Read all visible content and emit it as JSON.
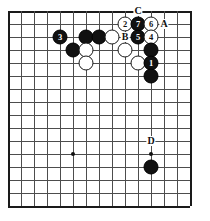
{
  "diagram": {
    "kind": "go-board-diagram",
    "title": "",
    "board": {
      "cols": 15,
      "rows": 16,
      "origin_x": 8,
      "origin_y": 11,
      "spacing": 13,
      "line_color": "#4d4d4d",
      "edge_color": "#1a1a1a",
      "background": "#ffffff"
    },
    "star_points": [
      {
        "col": 5,
        "row": 3
      },
      {
        "col": 5,
        "row": 11
      },
      {
        "col": 11,
        "row": 11
      }
    ],
    "stones": [
      {
        "col": 9,
        "row": 1,
        "color": "white",
        "label": "2"
      },
      {
        "col": 10,
        "row": 1,
        "color": "black",
        "label": "7"
      },
      {
        "col": 11,
        "row": 1,
        "color": "white",
        "label": "6"
      },
      {
        "col": 4,
        "row": 2,
        "color": "black",
        "label": "3"
      },
      {
        "col": 6,
        "row": 2,
        "color": "black",
        "label": ""
      },
      {
        "col": 7,
        "row": 2,
        "color": "black",
        "label": ""
      },
      {
        "col": 8,
        "row": 2,
        "color": "white",
        "label": ""
      },
      {
        "col": 10,
        "row": 2,
        "color": "black",
        "label": "5"
      },
      {
        "col": 11,
        "row": 2,
        "color": "white",
        "label": "4"
      },
      {
        "col": 5,
        "row": 3,
        "color": "black",
        "label": ""
      },
      {
        "col": 6,
        "row": 3,
        "color": "white",
        "label": ""
      },
      {
        "col": 9,
        "row": 3,
        "color": "white",
        "label": ""
      },
      {
        "col": 11,
        "row": 3,
        "color": "black",
        "label": ""
      },
      {
        "col": 6,
        "row": 4,
        "color": "white",
        "label": ""
      },
      {
        "col": 10,
        "row": 4,
        "color": "white",
        "label": ""
      },
      {
        "col": 11,
        "row": 4,
        "color": "black",
        "label": "1"
      },
      {
        "col": 11,
        "row": 5,
        "color": "black",
        "label": ""
      },
      {
        "col": 11,
        "row": 12,
        "color": "black",
        "label": ""
      }
    ],
    "point_labels": [
      {
        "col": 10,
        "row": 0,
        "text": "C"
      },
      {
        "col": 12,
        "row": 1,
        "text": "A"
      },
      {
        "col": 9,
        "row": 2,
        "text": "B"
      },
      {
        "col": 11,
        "row": 10,
        "text": "D"
      }
    ],
    "colors": {
      "black_stone": "#111111",
      "white_stone": "#ffffff",
      "stone_outline": "#1a1a1a",
      "label_text": "#111111"
    }
  }
}
